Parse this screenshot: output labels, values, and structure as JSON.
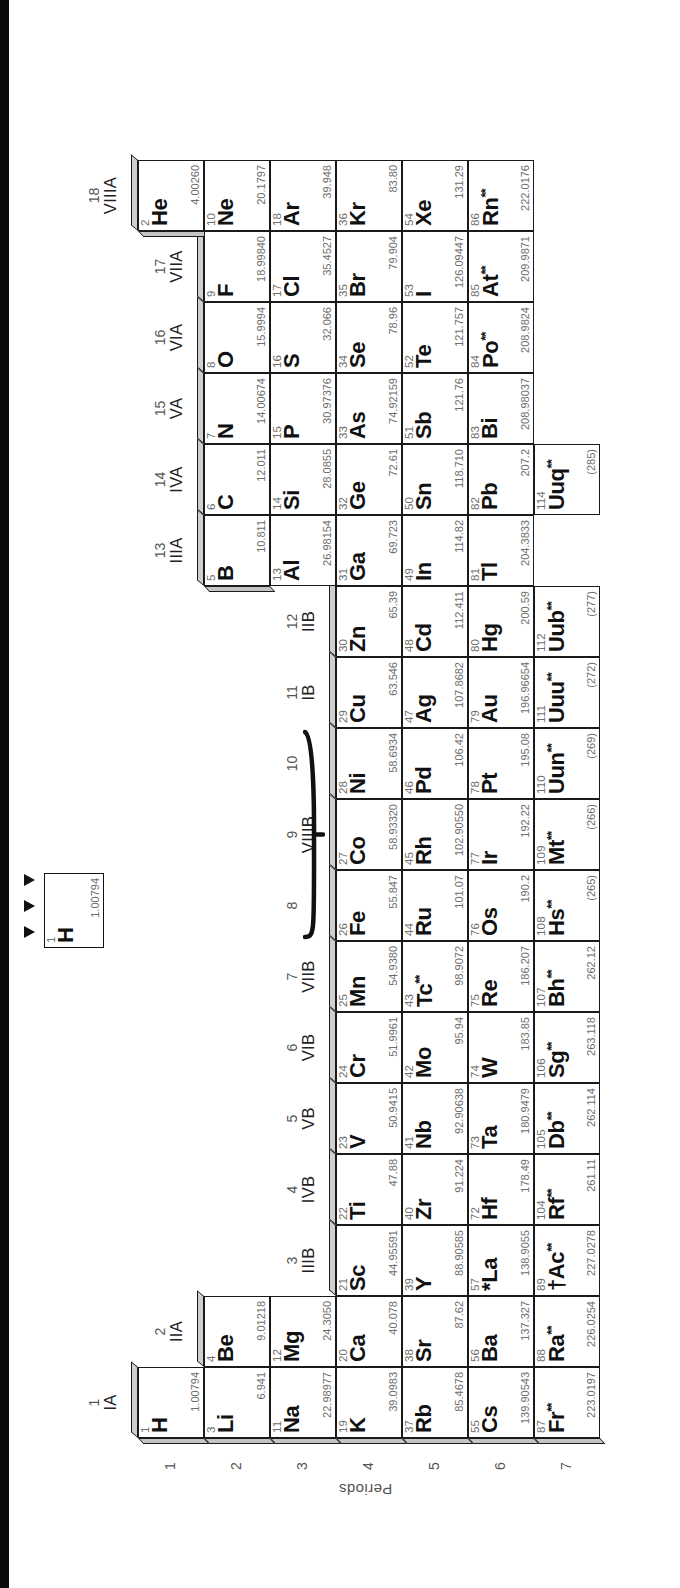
{
  "axis": {
    "periods_label": "Periods",
    "period_numbers": [
      "1",
      "2",
      "3",
      "4",
      "5",
      "6",
      "7"
    ]
  },
  "legend": {
    "lines": [
      "Atomic number",
      "Chemical symbol",
      "Atomic weight"
    ],
    "example": {
      "number": "1",
      "symbol": "H",
      "weight": "1.00794"
    }
  },
  "groups": [
    {
      "num": "1",
      "roman": "IA"
    },
    {
      "num": "2",
      "roman": "IIA"
    },
    {
      "num": "3",
      "roman": "IIIB"
    },
    {
      "num": "4",
      "roman": "IVB"
    },
    {
      "num": "5",
      "roman": "VB"
    },
    {
      "num": "6",
      "roman": "VIB"
    },
    {
      "num": "7",
      "roman": "VIIB"
    },
    {
      "num": "8",
      "roman": ""
    },
    {
      "num": "9",
      "roman": "VIIIB"
    },
    {
      "num": "10",
      "roman": ""
    },
    {
      "num": "11",
      "roman": "IB"
    },
    {
      "num": "12",
      "roman": "IIB"
    },
    {
      "num": "13",
      "roman": "IIIA"
    },
    {
      "num": "14",
      "roman": "IVA"
    },
    {
      "num": "15",
      "roman": "VA"
    },
    {
      "num": "16",
      "roman": "VIA"
    },
    {
      "num": "17",
      "roman": "VIIA"
    },
    {
      "num": "18",
      "roman": "VIIIA"
    }
  ],
  "elements": [
    {
      "z": "1",
      "sym": "H",
      "wt": "1.00794",
      "g": 1,
      "p": 1,
      "mark": ""
    },
    {
      "z": "2",
      "sym": "He",
      "wt": "4.00260",
      "g": 18,
      "p": 1,
      "mark": ""
    },
    {
      "z": "3",
      "sym": "Li",
      "wt": "6.941",
      "g": 1,
      "p": 2,
      "mark": ""
    },
    {
      "z": "4",
      "sym": "Be",
      "wt": "9.01218",
      "g": 2,
      "p": 2,
      "mark": ""
    },
    {
      "z": "5",
      "sym": "B",
      "wt": "10.811",
      "g": 13,
      "p": 2,
      "mark": ""
    },
    {
      "z": "6",
      "sym": "C",
      "wt": "12.011",
      "g": 14,
      "p": 2,
      "mark": ""
    },
    {
      "z": "7",
      "sym": "N",
      "wt": "14.00674",
      "g": 15,
      "p": 2,
      "mark": ""
    },
    {
      "z": "8",
      "sym": "O",
      "wt": "15.9994",
      "g": 16,
      "p": 2,
      "mark": ""
    },
    {
      "z": "9",
      "sym": "F",
      "wt": "18.99840",
      "g": 17,
      "p": 2,
      "mark": ""
    },
    {
      "z": "10",
      "sym": "Ne",
      "wt": "20.1797",
      "g": 18,
      "p": 2,
      "mark": ""
    },
    {
      "z": "11",
      "sym": "Na",
      "wt": "22.98977",
      "g": 1,
      "p": 3,
      "mark": ""
    },
    {
      "z": "12",
      "sym": "Mg",
      "wt": "24.3050",
      "g": 2,
      "p": 3,
      "mark": ""
    },
    {
      "z": "13",
      "sym": "Al",
      "wt": "26.98154",
      "g": 13,
      "p": 3,
      "mark": ""
    },
    {
      "z": "14",
      "sym": "Si",
      "wt": "28.0855",
      "g": 14,
      "p": 3,
      "mark": ""
    },
    {
      "z": "15",
      "sym": "P",
      "wt": "30.97376",
      "g": 15,
      "p": 3,
      "mark": ""
    },
    {
      "z": "16",
      "sym": "S",
      "wt": "32.066",
      "g": 16,
      "p": 3,
      "mark": ""
    },
    {
      "z": "17",
      "sym": "Cl",
      "wt": "35.4527",
      "g": 17,
      "p": 3,
      "mark": ""
    },
    {
      "z": "18",
      "sym": "Ar",
      "wt": "39.948",
      "g": 18,
      "p": 3,
      "mark": ""
    },
    {
      "z": "19",
      "sym": "K",
      "wt": "39.0983",
      "g": 1,
      "p": 4,
      "mark": ""
    },
    {
      "z": "20",
      "sym": "Ca",
      "wt": "40.078",
      "g": 2,
      "p": 4,
      "mark": ""
    },
    {
      "z": "21",
      "sym": "Sc",
      "wt": "44.95591",
      "g": 3,
      "p": 4,
      "mark": ""
    },
    {
      "z": "22",
      "sym": "Ti",
      "wt": "47.88",
      "g": 4,
      "p": 4,
      "mark": ""
    },
    {
      "z": "23",
      "sym": "V",
      "wt": "50.9415",
      "g": 5,
      "p": 4,
      "mark": ""
    },
    {
      "z": "24",
      "sym": "Cr",
      "wt": "51.9961",
      "g": 6,
      "p": 4,
      "mark": ""
    },
    {
      "z": "25",
      "sym": "Mn",
      "wt": "54.9380",
      "g": 7,
      "p": 4,
      "mark": ""
    },
    {
      "z": "26",
      "sym": "Fe",
      "wt": "55.847",
      "g": 8,
      "p": 4,
      "mark": ""
    },
    {
      "z": "27",
      "sym": "Co",
      "wt": "58.93320",
      "g": 9,
      "p": 4,
      "mark": ""
    },
    {
      "z": "28",
      "sym": "Ni",
      "wt": "58.6934",
      "g": 10,
      "p": 4,
      "mark": ""
    },
    {
      "z": "29",
      "sym": "Cu",
      "wt": "63.546",
      "g": 11,
      "p": 4,
      "mark": ""
    },
    {
      "z": "30",
      "sym": "Zn",
      "wt": "65.39",
      "g": 12,
      "p": 4,
      "mark": ""
    },
    {
      "z": "31",
      "sym": "Ga",
      "wt": "69.723",
      "g": 13,
      "p": 4,
      "mark": ""
    },
    {
      "z": "32",
      "sym": "Ge",
      "wt": "72.61",
      "g": 14,
      "p": 4,
      "mark": ""
    },
    {
      "z": "33",
      "sym": "As",
      "wt": "74.92159",
      "g": 15,
      "p": 4,
      "mark": ""
    },
    {
      "z": "34",
      "sym": "Se",
      "wt": "78.96",
      "g": 16,
      "p": 4,
      "mark": ""
    },
    {
      "z": "35",
      "sym": "Br",
      "wt": "79.904",
      "g": 17,
      "p": 4,
      "mark": ""
    },
    {
      "z": "36",
      "sym": "Kr",
      "wt": "83.80",
      "g": 18,
      "p": 4,
      "mark": ""
    },
    {
      "z": "37",
      "sym": "Rb",
      "wt": "85.4678",
      "g": 1,
      "p": 5,
      "mark": ""
    },
    {
      "z": "38",
      "sym": "Sr",
      "wt": "87.62",
      "g": 2,
      "p": 5,
      "mark": ""
    },
    {
      "z": "39",
      "sym": "Y",
      "wt": "88.90585",
      "g": 3,
      "p": 5,
      "mark": ""
    },
    {
      "z": "40",
      "sym": "Zr",
      "wt": "91.224",
      "g": 4,
      "p": 5,
      "mark": ""
    },
    {
      "z": "41",
      "sym": "Nb",
      "wt": "92.90638",
      "g": 5,
      "p": 5,
      "mark": ""
    },
    {
      "z": "42",
      "sym": "Mo",
      "wt": "95.94",
      "g": 6,
      "p": 5,
      "mark": ""
    },
    {
      "z": "43",
      "sym": "Tc",
      "wt": "98.9072",
      "g": 7,
      "p": 5,
      "mark": "**"
    },
    {
      "z": "44",
      "sym": "Ru",
      "wt": "101.07",
      "g": 8,
      "p": 5,
      "mark": ""
    },
    {
      "z": "45",
      "sym": "Rh",
      "wt": "102.90550",
      "g": 9,
      "p": 5,
      "mark": ""
    },
    {
      "z": "46",
      "sym": "Pd",
      "wt": "106.42",
      "g": 10,
      "p": 5,
      "mark": ""
    },
    {
      "z": "47",
      "sym": "Ag",
      "wt": "107.8682",
      "g": 11,
      "p": 5,
      "mark": ""
    },
    {
      "z": "48",
      "sym": "Cd",
      "wt": "112.411",
      "g": 12,
      "p": 5,
      "mark": ""
    },
    {
      "z": "49",
      "sym": "In",
      "wt": "114.82",
      "g": 13,
      "p": 5,
      "mark": ""
    },
    {
      "z": "50",
      "sym": "Sn",
      "wt": "118.710",
      "g": 14,
      "p": 5,
      "mark": ""
    },
    {
      "z": "51",
      "sym": "Sb",
      "wt": "121.76",
      "g": 15,
      "p": 5,
      "mark": ""
    },
    {
      "z": "52",
      "sym": "Te",
      "wt": "121.757",
      "g": 16,
      "p": 5,
      "mark": ""
    },
    {
      "z": "53",
      "sym": "I",
      "wt": "126.09447",
      "g": 17,
      "p": 5,
      "mark": ""
    },
    {
      "z": "54",
      "sym": "Xe",
      "wt": "131.29",
      "g": 18,
      "p": 5,
      "mark": ""
    },
    {
      "z": "55",
      "sym": "Cs",
      "wt": "139.90543",
      "g": 1,
      "p": 6,
      "mark": ""
    },
    {
      "z": "56",
      "sym": "Ba",
      "wt": "137.327",
      "g": 2,
      "p": 6,
      "mark": ""
    },
    {
      "z": "57",
      "sym": "*La",
      "wt": "138.9055",
      "g": 3,
      "p": 6,
      "mark": ""
    },
    {
      "z": "72",
      "sym": "Hf",
      "wt": "178.49",
      "g": 4,
      "p": 6,
      "mark": ""
    },
    {
      "z": "73",
      "sym": "Ta",
      "wt": "180.9479",
      "g": 5,
      "p": 6,
      "mark": ""
    },
    {
      "z": "74",
      "sym": "W",
      "wt": "183.85",
      "g": 6,
      "p": 6,
      "mark": ""
    },
    {
      "z": "75",
      "sym": "Re",
      "wt": "186.207",
      "g": 7,
      "p": 6,
      "mark": ""
    },
    {
      "z": "76",
      "sym": "Os",
      "wt": "190.2",
      "g": 8,
      "p": 6,
      "mark": ""
    },
    {
      "z": "77",
      "sym": "Ir",
      "wt": "192.22",
      "g": 9,
      "p": 6,
      "mark": ""
    },
    {
      "z": "78",
      "sym": "Pt",
      "wt": "195.08",
      "g": 10,
      "p": 6,
      "mark": ""
    },
    {
      "z": "79",
      "sym": "Au",
      "wt": "196.96654",
      "g": 11,
      "p": 6,
      "mark": ""
    },
    {
      "z": "80",
      "sym": "Hg",
      "wt": "200.59",
      "g": 12,
      "p": 6,
      "mark": ""
    },
    {
      "z": "81",
      "sym": "Tl",
      "wt": "204.3833",
      "g": 13,
      "p": 6,
      "mark": ""
    },
    {
      "z": "82",
      "sym": "Pb",
      "wt": "207.2",
      "g": 14,
      "p": 6,
      "mark": ""
    },
    {
      "z": "83",
      "sym": "Bi",
      "wt": "208.98037",
      "g": 15,
      "p": 6,
      "mark": ""
    },
    {
      "z": "84",
      "sym": "Po",
      "wt": "208.9824",
      "g": 16,
      "p": 6,
      "mark": "**"
    },
    {
      "z": "85",
      "sym": "At",
      "wt": "209.9871",
      "g": 17,
      "p": 6,
      "mark": "**"
    },
    {
      "z": "86",
      "sym": "Rn",
      "wt": "222.0176",
      "g": 18,
      "p": 6,
      "mark": "**"
    },
    {
      "z": "87",
      "sym": "Fr",
      "wt": "223.0197",
      "g": 1,
      "p": 7,
      "mark": "**"
    },
    {
      "z": "88",
      "sym": "Ra",
      "wt": "226.0254",
      "g": 2,
      "p": 7,
      "mark": "**"
    },
    {
      "z": "89",
      "sym": "†Ac",
      "wt": "227.0278",
      "g": 3,
      "p": 7,
      "mark": "**"
    },
    {
      "z": "104",
      "sym": "Rf",
      "wt": "261.11",
      "g": 4,
      "p": 7,
      "mark": "**"
    },
    {
      "z": "105",
      "sym": "Db",
      "wt": "262.114",
      "g": 5,
      "p": 7,
      "mark": "**"
    },
    {
      "z": "106",
      "sym": "Sg",
      "wt": "263.118",
      "g": 6,
      "p": 7,
      "mark": "**"
    },
    {
      "z": "107",
      "sym": "Bh",
      "wt": "262.12",
      "g": 7,
      "p": 7,
      "mark": "**"
    },
    {
      "z": "108",
      "sym": "Hs",
      "wt": "(265)",
      "g": 8,
      "p": 7,
      "mark": "**"
    },
    {
      "z": "109",
      "sym": "Mt",
      "wt": "(266)",
      "g": 9,
      "p": 7,
      "mark": "**"
    },
    {
      "z": "110",
      "sym": "Uun",
      "wt": "(269)",
      "g": 10,
      "p": 7,
      "mark": "**"
    },
    {
      "z": "111",
      "sym": "Uuu",
      "wt": "(272)",
      "g": 11,
      "p": 7,
      "mark": "**"
    },
    {
      "z": "112",
      "sym": "Uub",
      "wt": "(277)",
      "g": 12,
      "p": 7,
      "mark": "**"
    },
    {
      "z": "114",
      "sym": "Uuq",
      "wt": "(285)",
      "g": 14,
      "p": 7,
      "mark": "**"
    }
  ]
}
